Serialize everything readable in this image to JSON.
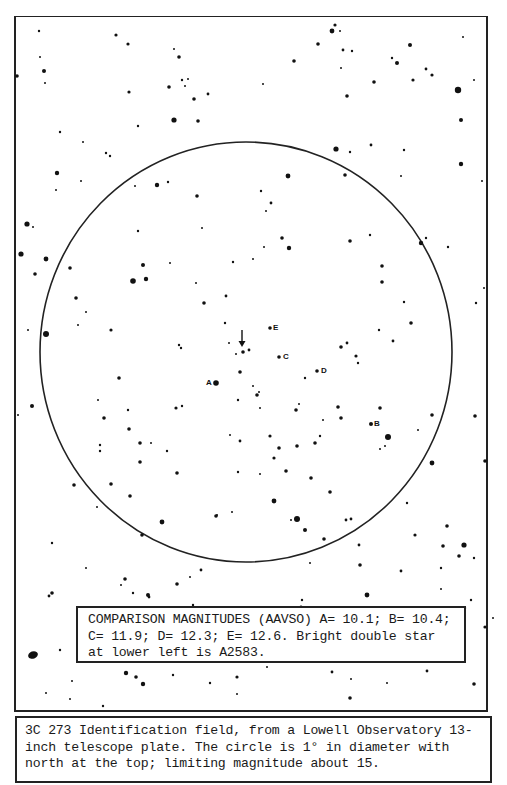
{
  "figure": {
    "title": "3C 273 identification field",
    "circle_diameter": "1°",
    "orientation": "north at the top",
    "target_marker": "down-arrow"
  },
  "comparison_labels": {
    "A": "A",
    "B": "B",
    "C": "C",
    "D": "D",
    "E": "E"
  },
  "magnitudes_box": {
    "line1": "COMPARISON MAGNITUDES (AAVSO) A= 10.1; B= 10.4;",
    "line2": "C= 11.9; D= 12.3; E= 12.6. Bright double star",
    "line3": "at lower left is A2583.",
    "values": {
      "A": 10.1,
      "B": 10.4,
      "C": 11.9,
      "D": 12.3,
      "E": 12.6
    }
  },
  "caption": {
    "line1": "3C 273 Identification field, from a Lowell Observatory 13-",
    "line2": "inch telescope plate. The circle is 1° in diameter with",
    "line3": "north at the top; limiting magnitude about 15."
  },
  "colors": {
    "background": "#ffffff",
    "ink": "#111111"
  }
}
